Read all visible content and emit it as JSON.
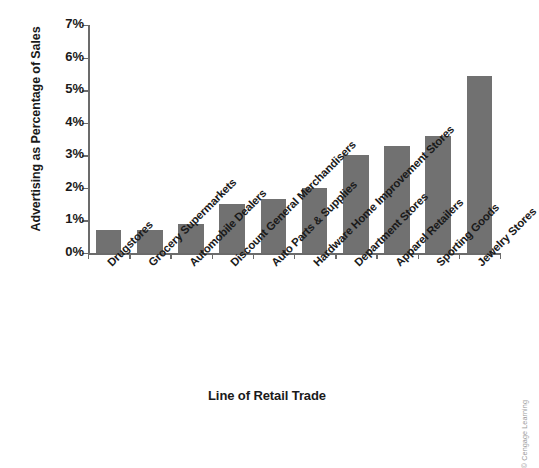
{
  "chart_data": {
    "type": "bar",
    "title": "",
    "xlabel": "Line of Retail Trade",
    "ylabel": "Advertising as Percentage of Sales",
    "categories": [
      "Drugstores",
      "Grocery Supermarkets",
      "Automobile Dealers",
      "Discount General Merchandisers",
      "Auto Parts & Supplies",
      "Hardware Home Improvement Stores",
      "Department Stores",
      "Apparel Retailers",
      "Sporting Goods",
      "Jewelry Stores"
    ],
    "values": [
      0.7,
      0.7,
      0.9,
      1.5,
      1.65,
      2.0,
      3.0,
      3.3,
      3.6,
      5.45
    ],
    "ylim": [
      0,
      7
    ],
    "ytick_labels": [
      "0%",
      "1%",
      "2%",
      "3%",
      "4%",
      "5%",
      "6%",
      "7%"
    ],
    "ytick_values": [
      0,
      1,
      2,
      3,
      4,
      5,
      6,
      7
    ],
    "grid": false,
    "legend": "none",
    "bar_color": "#717171",
    "axis_color": "#6b6b6b",
    "background_color": "#ffffff"
  },
  "credit": {
    "text": "© Cengage Learning",
    "color": "#9a9a9a"
  }
}
